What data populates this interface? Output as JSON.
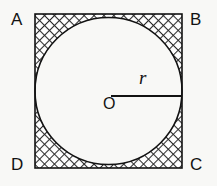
{
  "figure": {
    "kind": "geometry-diagram",
    "background_color": "#f8f8f6",
    "ink_color": "#121212",
    "hatch_color": "#2b2b2b"
  },
  "square": {
    "name": "square-ABCD",
    "x": 35,
    "y": 14,
    "width": 147,
    "height": 154,
    "stroke_width": 1.6
  },
  "circle": {
    "name": "inscribed-circle",
    "cx": 108.5,
    "cy": 91,
    "r": 73.5,
    "stroke_width": 1.6,
    "fill": "#ffffff"
  },
  "radius_segment": {
    "name": "radius-segment",
    "x1": 111,
    "y1": 96,
    "x2": 181,
    "y2": 96,
    "stroke_width": 2.0
  },
  "labels": {
    "vertices": [
      {
        "id": "A",
        "text": "A",
        "corner": "top-left"
      },
      {
        "id": "B",
        "text": "B",
        "corner": "top-right"
      },
      {
        "id": "C",
        "text": "C",
        "corner": "bottom-right"
      },
      {
        "id": "D",
        "text": "D",
        "corner": "bottom-left"
      }
    ],
    "center": {
      "id": "O",
      "text": "O"
    },
    "radius": {
      "id": "r",
      "text": "r"
    }
  }
}
